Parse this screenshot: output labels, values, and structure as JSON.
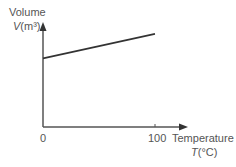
{
  "chart_data": {
    "type": "line",
    "title": "",
    "xlabel": "Temperature",
    "xlabel_symbol": "T",
    "xlabel_unit": "(°C)",
    "ylabel": "Volume",
    "ylabel_symbol": "V",
    "ylabel_unit": "(m³)",
    "x_ticks": [
      "0",
      "100"
    ],
    "y_ticks": [],
    "x": [
      0,
      100
    ],
    "series": [
      {
        "name": "Volume",
        "values": [
          0.7,
          0.95
        ]
      }
    ],
    "xlim": [
      0,
      110
    ],
    "ylim": [
      0,
      1
    ],
    "grid": false,
    "legend": "none"
  },
  "labels": {
    "y_title": "Volume",
    "y_symbol": "V",
    "y_unit": "(m³)",
    "x_title": "Temperature",
    "x_symbol": "T",
    "x_unit": "(°C)",
    "x_tick_0": "0",
    "x_tick_100": "100"
  },
  "colors": {
    "axis": "#555555",
    "line": "#333333",
    "text": "#555555"
  }
}
